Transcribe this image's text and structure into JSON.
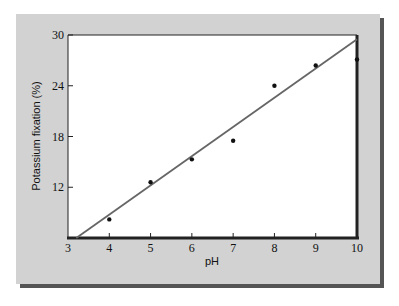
{
  "chart_data": {
    "type": "scatter",
    "title": "",
    "xlabel": "pH",
    "ylabel": "Potassium fixation (%)",
    "xlim": [
      3,
      10
    ],
    "ylim": [
      6,
      30
    ],
    "xticks": [
      3,
      4,
      5,
      6,
      7,
      8,
      9,
      10
    ],
    "yticks": [
      12,
      18,
      24,
      30
    ],
    "grid": false,
    "legend": null,
    "series": [
      {
        "name": "observed",
        "type": "scatter",
        "x": [
          4,
          5,
          6,
          7,
          8,
          9,
          10
        ],
        "y": [
          8.2,
          12.6,
          15.3,
          17.5,
          24.0,
          26.4,
          27.1
        ]
      },
      {
        "name": "fitted line",
        "type": "line",
        "x": [
          3.2,
          10
        ],
        "y": [
          6.0,
          29.5
        ]
      }
    ]
  },
  "labels": {
    "x_axis": "pH",
    "y_axis": "Potassium fixation (%)",
    "xticks": [
      "3",
      "4",
      "5",
      "6",
      "7",
      "8",
      "9",
      "10"
    ],
    "yticks": [
      "30",
      "24",
      "18",
      "12"
    ]
  }
}
